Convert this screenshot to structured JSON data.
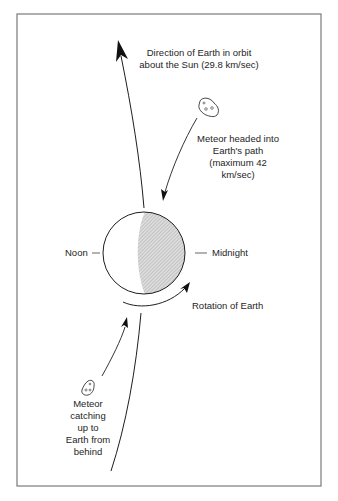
{
  "diagram": {
    "colors": {
      "border": "#7a7a7a",
      "stroke": "#1e1e1e",
      "night_fill": "#cfcfcf",
      "background": "#ffffff"
    },
    "labels": {
      "orbit_direction": {
        "line1": "Direction of Earth in orbit",
        "line2": "about the Sun (29.8 km/sec)"
      },
      "meteor_ahead": {
        "line1": "Meteor headed into",
        "line2": "Earth's path",
        "line3": "(maximum 42",
        "line4": "km/sec)"
      },
      "noon": "Noon",
      "midnight": "Midnight",
      "rotation": "Rotation of Earth",
      "meteor_behind": {
        "line1": "Meteor",
        "line2": "catching",
        "line3": "up to",
        "line4": "Earth from",
        "line5": "behind"
      }
    },
    "icons": {
      "meteor_upper": "meteor-icon",
      "meteor_lower": "meteor-icon",
      "earth": "earth-circle-icon"
    }
  }
}
